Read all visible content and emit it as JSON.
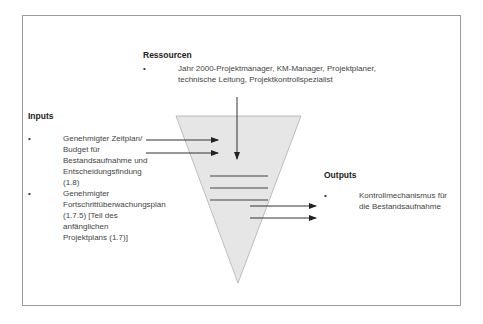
{
  "resources": {
    "title": "Ressourcen",
    "items": [
      "Jahr 2000-Projektmanager, KM-Manager, Projektplaner, technische Leitung, Projektkontrollspezialist"
    ]
  },
  "inputs": {
    "title": "Inputs",
    "items": [
      "Genehmigter Zeitplan/ Budget für Bestandsaufnahme und Entscheidungsfindung (1.8)",
      "Genehmigter Fortschrittüberwachungsplan (1.7.5) [Teil des anfänglichen Projektplans (1.7)]"
    ]
  },
  "outputs": {
    "title": "Outputs",
    "items": [
      "Kontrollmechanismus für die Bestandsaufnahme"
    ]
  },
  "colors": {
    "frame": "#9a9a9a",
    "funnel_fill": "#e6e6e6",
    "funnel_stroke": "#b0b0b0",
    "arrow": "#333333"
  }
}
